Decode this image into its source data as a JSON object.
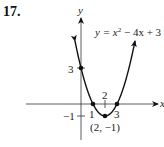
{
  "problem": {
    "number": "17."
  },
  "chart_data": {
    "type": "line",
    "title": "",
    "equation": "y = x² − 4x + 3",
    "function": "x^2 - 4x + 3",
    "xlabel": "x",
    "ylabel": "y",
    "xlim": [
      -1,
      6
    ],
    "ylim": [
      -2,
      7
    ],
    "grid": false,
    "curve_domain": [
      -0.5,
      4.5
    ],
    "series": [
      {
        "name": "y = x² − 4x + 3",
        "x": [
          -0.5,
          0,
          0.5,
          1,
          1.5,
          2,
          2.5,
          3,
          3.5,
          4,
          4.5
        ],
        "y": [
          5.25,
          3,
          1.25,
          0,
          -0.75,
          -1,
          -0.75,
          0,
          1.25,
          3,
          5.25
        ]
      }
    ],
    "marked_points": [
      {
        "x": 0,
        "y": 3,
        "label": "3"
      },
      {
        "x": 1,
        "y": 0,
        "label": "1"
      },
      {
        "x": 3,
        "y": 0,
        "label": "3"
      },
      {
        "x": 2,
        "y": -1,
        "label": "(2, −1)"
      }
    ],
    "tick_labels": {
      "x": [
        {
          "value": 1,
          "label": "1"
        },
        {
          "value": 2,
          "label": "2"
        },
        {
          "value": 3,
          "label": "3"
        }
      ],
      "y": [
        {
          "value": 3,
          "label": "3"
        },
        {
          "value": -1,
          "label": "−1"
        }
      ]
    },
    "annotations": [
      "y = x² − 4x + 3",
      "(2, −1)"
    ]
  },
  "labels": {
    "y_axis": "y",
    "x_axis": "x",
    "equation_prefix": "y = x",
    "equation_exp": "2",
    "equation_suffix": " − 4x + 3",
    "y_tick_3": "3",
    "y_tick_neg1": "−1",
    "x_tick_1": "1",
    "x_tick_2": "2",
    "x_tick_3": "3",
    "vertex": "(2, −1)"
  }
}
